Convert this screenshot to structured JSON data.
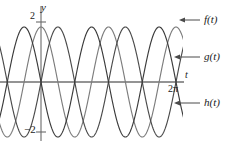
{
  "figure": {
    "type": "line-plot",
    "background": "#ffffff",
    "axis_color": "#2b2b2b",
    "label_color": "#1a1a1a"
  },
  "axes": {
    "y_axis_label": "y",
    "x_axis_label": "t",
    "y_tick_top_label": "2",
    "y_tick_bottom_label": "−2",
    "x_tick_label": "2π",
    "origin_px": {
      "x": 41,
      "y": 82
    },
    "x_range": [
      -1.05,
      2.6
    ],
    "y_range": [
      -2.35,
      2.35
    ],
    "unit_px_x": 67.5,
    "unit_px_y": 27.5,
    "grid": false
  },
  "annotations": [
    {
      "name": "f-label",
      "text": "f(t)",
      "arrow_from_px": {
        "x": 200,
        "y": 20
      },
      "arrow_to_px": {
        "x": 179,
        "y": 20
      }
    },
    {
      "name": "g-label",
      "text": "g(t)",
      "arrow_from_px": {
        "x": 200,
        "y": 57
      },
      "arrow_to_px": {
        "x": 174,
        "y": 57
      }
    },
    {
      "name": "h-label",
      "text": "h(t)",
      "arrow_from_px": {
        "x": 200,
        "y": 103
      },
      "arrow_to_px": {
        "x": 174,
        "y": 103
      }
    }
  ],
  "chart_data": {
    "type": "line",
    "title": "",
    "xlabel": "t",
    "ylabel": "y",
    "xlim": [
      -1.05,
      2.6
    ],
    "ylim": [
      -2.35,
      2.35
    ],
    "xticks": [
      {
        "value": 2.0,
        "label": "2π"
      }
    ],
    "yticks": [
      {
        "value": 2,
        "label": "2"
      },
      {
        "value": -2,
        "label": "−2"
      }
    ],
    "grid": false,
    "legend_position": "right-outside",
    "x_unit": "pi",
    "note": "x values expressed in units of π over the plotted window",
    "series": [
      {
        "name": "f(t)",
        "color": "#7c7c7c",
        "form": "2*cos(2*pi*x)",
        "amplitude": 2,
        "period_in_pi": 1,
        "phase_deg": 0,
        "x": [
          -1.05,
          -0.9,
          -0.75,
          -0.6,
          -0.45,
          -0.3,
          -0.15,
          0,
          0.15,
          0.3,
          0.45,
          0.6,
          0.75,
          0.9,
          1.05,
          1.2,
          1.35,
          1.5,
          1.65,
          1.8,
          1.95,
          2.1,
          2.25,
          2.4,
          2.55
        ],
        "y": [
          1.9,
          0.62,
          -1.18,
          -1.9,
          -0.62,
          1.18,
          1.9,
          2.0,
          1.18,
          -0.62,
          -1.9,
          -1.18,
          0.62,
          1.9,
          1.9,
          0.62,
          -1.18,
          -1.9,
          -0.62,
          1.18,
          1.9,
          1.18,
          -0.62,
          -1.9,
          -1.18
        ]
      },
      {
        "name": "g(t)",
        "color": "#4a4a4a",
        "form": "2*sin(2*pi*x)",
        "amplitude": 2,
        "period_in_pi": 1,
        "phase_deg": -90,
        "x": [
          -1.05,
          -0.9,
          -0.75,
          -0.6,
          -0.45,
          -0.3,
          -0.15,
          0,
          0.15,
          0.3,
          0.45,
          0.6,
          0.75,
          0.9,
          1.05,
          1.2,
          1.35,
          1.5,
          1.65,
          1.8,
          1.95,
          2.1,
          2.25,
          2.4,
          2.55
        ],
        "y": [
          -0.62,
          -1.9,
          -1.62,
          0.62,
          1.9,
          1.62,
          -0.62,
          0.0,
          1.62,
          1.9,
          0.62,
          -1.62,
          -1.9,
          -0.62,
          -0.62,
          -1.9,
          -1.62,
          0.62,
          1.9,
          1.62,
          -0.62,
          1.62,
          1.9,
          0.62,
          -1.62
        ]
      },
      {
        "name": "h(t)",
        "color": "#3a3a3a",
        "form": "-2*sin(2*pi*x)",
        "amplitude": 2,
        "period_in_pi": 1,
        "phase_deg": 90,
        "x": [
          -1.05,
          -0.9,
          -0.75,
          -0.6,
          -0.45,
          -0.3,
          -0.15,
          0,
          0.15,
          0.3,
          0.45,
          0.6,
          0.75,
          0.9,
          1.05,
          1.2,
          1.35,
          1.5,
          1.65,
          1.8,
          1.95,
          2.1,
          2.25,
          2.4,
          2.55
        ],
        "y": [
          0.62,
          1.9,
          1.62,
          -0.62,
          -1.9,
          -1.62,
          0.62,
          0.0,
          -1.62,
          -1.9,
          -0.62,
          1.62,
          1.9,
          0.62,
          0.62,
          1.9,
          1.62,
          -0.62,
          -1.9,
          -1.62,
          0.62,
          -1.62,
          -1.9,
          -0.62,
          1.62
        ]
      }
    ]
  }
}
